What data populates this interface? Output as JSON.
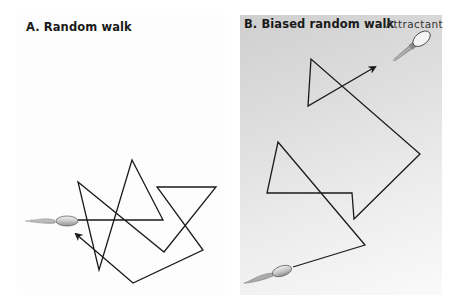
{
  "panels": [
    {
      "id": "A",
      "title": "A. Random walk",
      "background": "#fdfdfd",
      "path_points": [
        [
          78,
          220
        ],
        [
          163,
          220
        ],
        [
          132,
          160
        ],
        [
          99,
          270
        ],
        [
          78,
          182
        ],
        [
          164,
          252
        ],
        [
          216,
          187
        ],
        [
          157,
          187
        ],
        [
          203,
          250
        ],
        [
          133,
          283
        ],
        [
          76,
          234
        ]
      ],
      "bacterium": {
        "position": [
          67,
          221
        ],
        "orientation_deg": 0
      },
      "arrow_end": [
        74,
        232
      ]
    },
    {
      "id": "B",
      "title": "B. Biased random walk",
      "background_gradient": [
        "#cfcfcf",
        "#fafafa"
      ],
      "path_points": [
        [
          293,
          267
        ],
        [
          365,
          245
        ],
        [
          278,
          142
        ],
        [
          267,
          193
        ],
        [
          352,
          193
        ],
        [
          354,
          219
        ],
        [
          420,
          154
        ],
        [
          311,
          59
        ],
        [
          308,
          106
        ],
        [
          375,
          67
        ]
      ],
      "bacterium": {
        "position": [
          282,
          271
        ],
        "orientation_deg": -18
      },
      "attractant": {
        "label": "Attractant",
        "position": [
          410,
          43
        ],
        "orientation_deg": -38
      },
      "arrow_end": [
        377,
        66
      ]
    }
  ],
  "colors": {
    "line": "#1a1a1a",
    "bacterium_body": "#c8c8c8",
    "bacterium_outline": "#555555"
  }
}
